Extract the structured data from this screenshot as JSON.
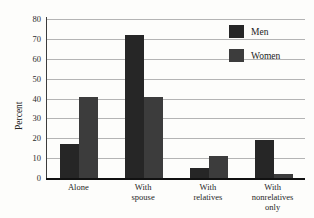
{
  "chart_data": {
    "type": "bar",
    "title": "",
    "xlabel": "",
    "ylabel": "Percent",
    "ylim": [
      0,
      80
    ],
    "ytick_step": 10,
    "yticks": [
      "0",
      "10",
      "20",
      "30",
      "40",
      "50",
      "60",
      "70",
      "80"
    ],
    "grid": true,
    "legend_position": "top-right",
    "categories": [
      "Alone",
      "With spouse",
      "With relatives",
      "With nonrelatives only"
    ],
    "category_lines": [
      [
        "Alone"
      ],
      [
        "With",
        "spouse"
      ],
      [
        "With",
        "relatives"
      ],
      [
        "With",
        "nonrelatives",
        "only"
      ]
    ],
    "series": [
      {
        "name": "Men",
        "color": "#262626",
        "values": [
          17,
          72,
          5,
          19
        ]
      },
      {
        "name": "Women",
        "color": "#3c3c3c",
        "values": [
          41,
          41,
          11,
          2
        ]
      }
    ]
  },
  "legend": {
    "items": [
      {
        "label": "Men"
      },
      {
        "label": "Women"
      }
    ]
  },
  "colors": {
    "men": "#262626",
    "women": "#3c3c3c",
    "gridline": "#b4b4b4",
    "axis": "#3b3b3b",
    "baseline": "#111111",
    "background": "#fdfdfb"
  }
}
